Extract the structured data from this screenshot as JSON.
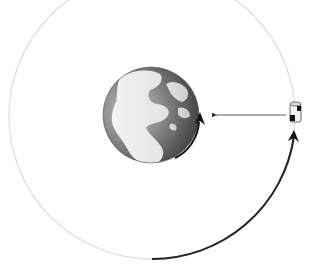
{
  "diagram": {
    "elements": {
      "orbit": {
        "label": "orbit-path",
        "color": "#dcdcdc"
      },
      "orbit_arc": {
        "label": "satellite-motion-arc",
        "color": "#222222"
      },
      "earth": {
        "label": "earth",
        "rotation_arrow_color": "#111111"
      },
      "satellite": {
        "label": "satellite"
      },
      "signal": {
        "label": "signal-arrow",
        "color": "#333333"
      }
    }
  }
}
